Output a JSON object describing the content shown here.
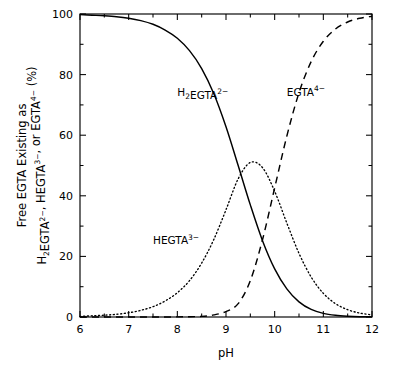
{
  "figure": {
    "title": "",
    "background_color": "#ffffff",
    "line_color": "#000000"
  },
  "axes": {
    "x": {
      "label": "pH",
      "min": 6,
      "max": 12,
      "ticks": [
        6,
        7,
        8,
        9,
        10,
        11,
        12
      ],
      "tick_labels": [
        "6",
        "7",
        "8",
        "9",
        "10",
        "11",
        "12"
      ],
      "minor_step": 0.5
    },
    "y": {
      "label_line1": "Free EGTA Existing as",
      "label_line2_parts": [
        {
          "text": "H",
          "style": "normal"
        },
        {
          "text": "2",
          "style": "sub"
        },
        {
          "text": "EGTA",
          "style": "normal"
        },
        {
          "text": "2−",
          "style": "sup"
        },
        {
          "text": ", HEGTA",
          "style": "normal"
        },
        {
          "text": "3−",
          "style": "sup"
        },
        {
          "text": ", or EGTA",
          "style": "normal"
        },
        {
          "text": "4−",
          "style": "sup"
        },
        {
          "text": " (%)",
          "style": "normal"
        }
      ],
      "label_plain": "Free EGTA Existing as H2EGTA2-, HEGTA3-, or EGTA4- (%)",
      "min": 0,
      "max": 100,
      "ticks": [
        0,
        20,
        40,
        60,
        80,
        100
      ],
      "tick_labels": [
        "0",
        "20",
        "40",
        "60",
        "80",
        "100"
      ],
      "minor_step": 10,
      "unit": "%"
    }
  },
  "chart_data": {
    "type": "line",
    "title": "",
    "xlabel": "pH",
    "ylabel": "Free EGTA Existing as H2EGTA2-, HEGTA3-, or EGTA4- (%)",
    "xlim": [
      6,
      12
    ],
    "ylim": [
      0,
      100
    ],
    "grid": false,
    "legend": "inline-annotations",
    "x": [
      6.0,
      6.25,
      6.5,
      6.75,
      7.0,
      7.25,
      7.5,
      7.75,
      8.0,
      8.25,
      8.5,
      8.75,
      9.0,
      9.25,
      9.5,
      9.75,
      10.0,
      10.25,
      10.5,
      10.75,
      11.0,
      11.25,
      11.5,
      11.75,
      12.0
    ],
    "series": [
      {
        "name": "H2EGTA2-",
        "label_html": "H<sub>2</sub>EGTA<sup>2−</sup>",
        "style": "solid",
        "color": "#000000",
        "label_position": {
          "x": 8.0,
          "y": 73
        },
        "values": [
          99.8,
          99.6,
          99.4,
          99.1,
          98.6,
          97.8,
          96.6,
          94.7,
          92.0,
          87.9,
          82.0,
          73.7,
          62.8,
          50.0,
          37.0,
          25.2,
          15.9,
          9.3,
          5.0,
          2.5,
          1.2,
          0.55,
          0.25,
          0.1,
          0.05
        ]
      },
      {
        "name": "HEGTA3-",
        "label_html": "HEGTA<sup>3−</sup>",
        "style": "dotted",
        "color": "#000000",
        "label_position": {
          "x": 7.5,
          "y": 24
        },
        "values": [
          0.2,
          0.4,
          0.6,
          0.9,
          1.4,
          2.2,
          3.4,
          5.3,
          8.0,
          12.0,
          17.8,
          25.6,
          35.4,
          45.6,
          51.0,
          49.3,
          41.5,
          31.0,
          21.0,
          13.2,
          7.8,
          4.4,
          2.4,
          1.3,
          0.7
        ]
      },
      {
        "name": "EGTA4-",
        "label_html": "EGTA<sup>4−</sup>",
        "style": "dashed",
        "color": "#000000",
        "label_position": {
          "x": 10.25,
          "y": 73
        },
        "values": [
          0.0,
          0.0,
          0.0,
          0.0,
          0.0,
          0.0,
          0.0,
          0.0,
          0.05,
          0.1,
          0.2,
          0.7,
          1.8,
          4.4,
          12.0,
          25.5,
          42.6,
          59.7,
          74.0,
          84.3,
          91.0,
          95.05,
          97.35,
          98.6,
          99.25
        ]
      }
    ],
    "annotations": [
      {
        "text": "H2EGTA2-",
        "x": 8.0,
        "y": 73
      },
      {
        "text": "HEGTA3-",
        "x": 7.5,
        "y": 24
      },
      {
        "text": "EGTA4-",
        "x": 10.25,
        "y": 73
      }
    ]
  }
}
